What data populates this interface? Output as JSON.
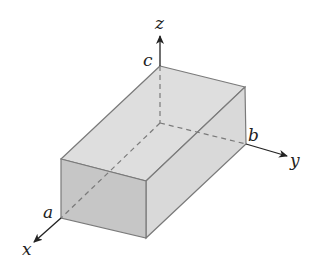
{
  "figure": {
    "axes": {
      "x": {
        "label": "x",
        "point_label": "a"
      },
      "y": {
        "label": "y",
        "point_label": "b"
      },
      "z": {
        "label": "z",
        "point_label": "c"
      }
    },
    "colors": {
      "top_face": "#dedede",
      "right_face": "#d9d9d9",
      "front_face": "#c6c6c6",
      "edge": "#7a7a7a",
      "hidden_edge": "#7a7a7a",
      "axis": "#222222"
    }
  }
}
